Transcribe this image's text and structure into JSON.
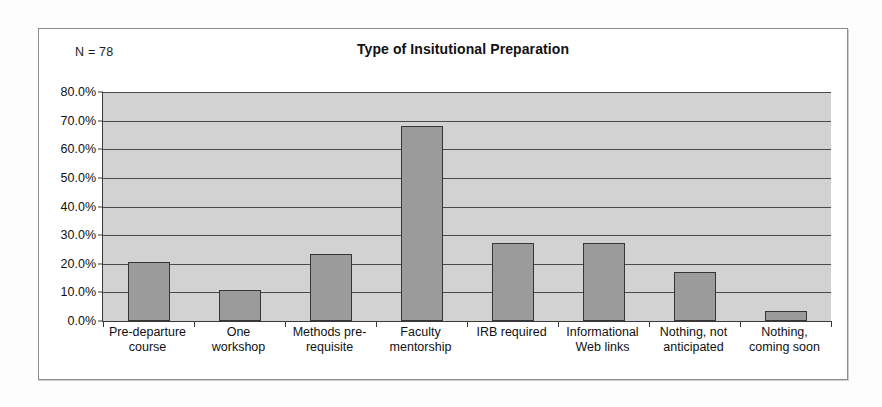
{
  "chart_data": {
    "type": "bar",
    "title": "Type of Insitutional Preparation",
    "xlabel": "",
    "ylabel": "",
    "annotation": "N = 78",
    "sample_size": 78,
    "grid": true,
    "legend": "none",
    "ylim": [
      0,
      80
    ],
    "ytick_labels": [
      "80.0%",
      "70.0%",
      "60.0%",
      "50.0%",
      "40.0%",
      "30.0%",
      "20.0%",
      "10.0%",
      "0.0%"
    ],
    "ytick_values": [
      80,
      70,
      60,
      50,
      40,
      30,
      20,
      10,
      0
    ],
    "categories": [
      "Pre-departure course",
      "One workshop",
      "Methods pre-requisite",
      "Faculty mentorship",
      "IRB required",
      "Informational Web links",
      "Nothing, not anticipated",
      "Nothing, coming soon"
    ],
    "category_lines": [
      [
        "Pre-departure",
        "course"
      ],
      [
        "One",
        "workshop"
      ],
      [
        "Methods pre-",
        "requisite"
      ],
      [
        "Faculty",
        "mentorship"
      ],
      [
        "IRB required",
        ""
      ],
      [
        "Informational",
        "Web links"
      ],
      [
        "Nothing, not",
        "anticipated"
      ],
      [
        "Nothing,",
        "coming soon"
      ]
    ],
    "values": [
      20.6,
      10.8,
      23.5,
      68.2,
      27.1,
      27.1,
      17.0,
      3.5
    ],
    "value_labels": [
      "20.6%",
      "10.8%",
      "23.5%",
      "68.2%",
      "27.1%",
      "27.1%",
      "17.0%",
      "3.5%"
    ],
    "colors": {
      "bar_fill": "#9b9b9b",
      "bar_border": "#363636",
      "plot_background": "#d2d2d2",
      "gridline": "#4a4a4a",
      "frame_border": "#8c8c8c",
      "text": "#111111",
      "page_background": "#fdfdfd"
    }
  }
}
